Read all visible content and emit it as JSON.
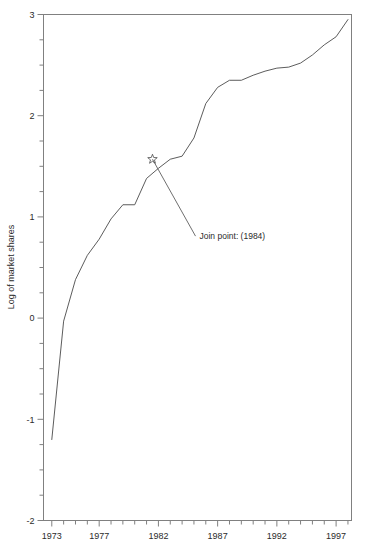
{
  "chart_data": {
    "type": "line",
    "title": "",
    "xlabel": "",
    "ylabel": "Log of market shares",
    "xlim": [
      1972.3,
      1998.3
    ],
    "ylim": [
      -2,
      3
    ],
    "grid": false,
    "legend": null,
    "x_tick_labels": [
      "1973",
      "1977",
      "1982",
      "1987",
      "1992",
      "1997"
    ],
    "x_tick_values": [
      1973,
      1977,
      1982,
      1987,
      1992,
      1997
    ],
    "x_minor_tick_values": [
      1974,
      1975,
      1976,
      1978,
      1979,
      1980,
      1981,
      1983,
      1984,
      1985,
      1986,
      1988,
      1989,
      1990,
      1991,
      1993,
      1994,
      1995,
      1996,
      1998
    ],
    "y_tick_labels": [
      "3",
      "2",
      "1",
      "0",
      "-1",
      "-2"
    ],
    "y_tick_values": [
      3,
      2,
      1,
      0,
      -1,
      -2
    ],
    "y_minor_tick_values": [
      2.75,
      2.5,
      2.25,
      1.75,
      1.5,
      1.25,
      0.75,
      0.5,
      0.25,
      -0.25,
      -0.5,
      -0.75,
      -1.25,
      -1.5,
      -1.75
    ],
    "series": [
      {
        "name": "Log of market shares",
        "x": [
          1973,
          1974,
          1975,
          1976,
          1977,
          1978,
          1979,
          1980,
          1981,
          1982,
          1983,
          1984,
          1985,
          1986,
          1987,
          1988,
          1989,
          1990,
          1991,
          1992,
          1993,
          1994,
          1995,
          1996,
          1997,
          1998
        ],
        "values": [
          -1.2,
          -0.03,
          0.38,
          0.62,
          0.78,
          0.98,
          1.12,
          1.12,
          1.38,
          1.48,
          1.57,
          1.6,
          1.78,
          2.12,
          2.28,
          2.35,
          2.35,
          2.4,
          2.44,
          2.47,
          2.48,
          2.52,
          2.6,
          2.7,
          2.78,
          2.95
        ]
      }
    ],
    "annotations": [
      {
        "text": "Join point: (1984)",
        "marker": "star",
        "point_x": 1981.5,
        "point_y": 1.57,
        "label_x": 1985.3,
        "label_y": 0.82
      }
    ],
    "colors": {
      "line": "#4a4a4a",
      "axis": "#808080",
      "text": "#2b2b2b",
      "background": "#ffffff"
    }
  }
}
